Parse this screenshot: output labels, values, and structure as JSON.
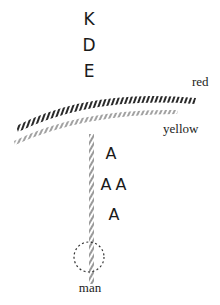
{
  "diagram": {
    "letters_top": [
      "K",
      "D",
      "E"
    ],
    "letters_below": [
      "A",
      "A",
      "A",
      "A"
    ],
    "labels": {
      "red": "red",
      "yellow": "yellow",
      "man": "man"
    },
    "colors": {
      "ink": "#1a1a1a",
      "background": "#ffffff"
    }
  }
}
